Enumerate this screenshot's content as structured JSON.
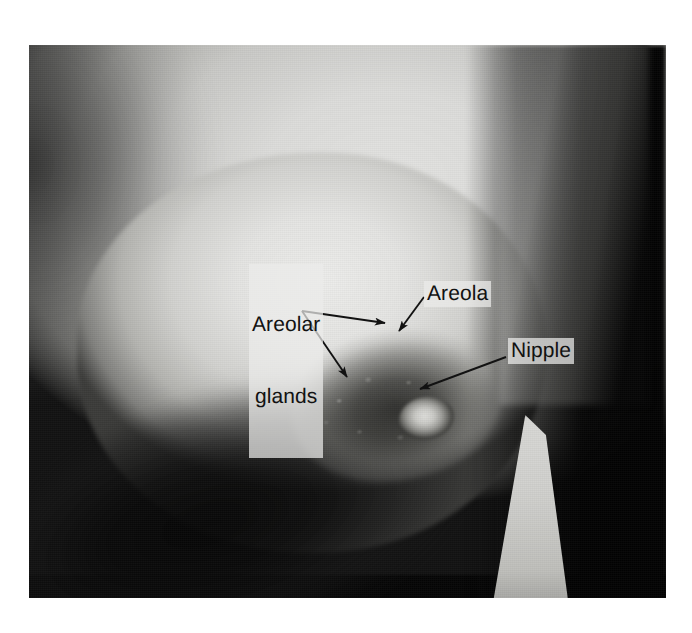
{
  "figure": {
    "type": "anatomical-photograph",
    "plate": {
      "left": 29,
      "top": 45,
      "width": 637,
      "height": 553,
      "background_color": "#0a0a0a"
    },
    "page_background": "#ffffff"
  },
  "annotations": {
    "label_color": "#121212",
    "leader_color": "#121212",
    "items": [
      {
        "id": "areolar-glands",
        "text": "Areolar\nglands",
        "line1": "Areolar",
        "line2": "glands",
        "x": 249,
        "y": 264
      },
      {
        "id": "areola",
        "text": "Areola",
        "x": 424,
        "y": 281
      },
      {
        "id": "nipple",
        "text": "Nipple",
        "x": 508,
        "y": 338
      }
    ],
    "leaders": [
      {
        "id": "leader-areolar-glands-upper",
        "from": [
          302,
          311
        ],
        "to": [
          385,
          323
        ],
        "target": "areolar-glands"
      },
      {
        "id": "leader-areolar-glands-lower",
        "from": [
          302,
          311
        ],
        "to": [
          347,
          377
        ],
        "target": "areolar-glands"
      },
      {
        "id": "leader-areola",
        "from": [
          424,
          297
        ],
        "to": [
          399,
          331
        ],
        "target": "areola"
      },
      {
        "id": "leader-nipple",
        "from": [
          506,
          357
        ],
        "to": [
          420,
          389
        ],
        "target": "nipple"
      }
    ]
  }
}
